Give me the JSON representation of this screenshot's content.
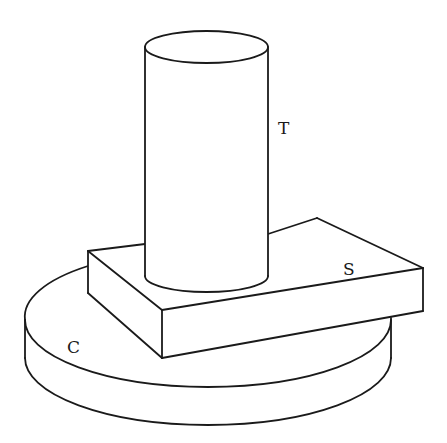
{
  "figure": {
    "line_color": "#1a1a1a",
    "background": "#ffffff"
  },
  "labels": {
    "cylinder": "T",
    "slab": "S",
    "disk": "C"
  },
  "objects": [
    {
      "id": "T",
      "shape": "cylinder",
      "role": "top"
    },
    {
      "id": "S",
      "shape": "rectangular slab",
      "role": "middle"
    },
    {
      "id": "C",
      "shape": "disk",
      "role": "base"
    }
  ]
}
